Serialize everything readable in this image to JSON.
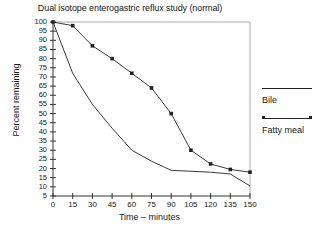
{
  "chart_data": {
    "type": "line",
    "title": "Dual isotope enterogastric reflux study (normal)",
    "xlabel": "Time – minutes",
    "ylabel": "Percent remaining",
    "x": [
      0,
      15,
      30,
      45,
      60,
      75,
      90,
      105,
      120,
      135,
      150
    ],
    "xlim": [
      0,
      150
    ],
    "ylim": [
      5,
      100
    ],
    "ytick_labels": [
      "100",
      "95",
      "90",
      "85",
      "80",
      "75",
      "70",
      "65",
      "60",
      "55",
      "50",
      "45",
      "40",
      "35",
      "30",
      "25",
      "20",
      "15",
      "10",
      "5"
    ],
    "xtick_labels": [
      "0",
      "15",
      "30",
      "45",
      "60",
      "75",
      "90",
      "105",
      "120",
      "135",
      "150"
    ],
    "grid": false,
    "legend_position": "right",
    "series": [
      {
        "name": "Bile",
        "marker": "none",
        "color": "#222222",
        "values": [
          100,
          72,
          55,
          42,
          30,
          24,
          19,
          18.5,
          18,
          17,
          10.5
        ]
      },
      {
        "name": "Fatty meal",
        "marker": "square",
        "color": "#222222",
        "values": [
          100,
          98,
          87,
          80,
          72,
          64,
          50,
          30,
          22.5,
          19.5,
          18
        ]
      }
    ]
  },
  "legend": {
    "entries": [
      {
        "label": "Bile"
      },
      {
        "label": "Fatty meal"
      }
    ]
  }
}
